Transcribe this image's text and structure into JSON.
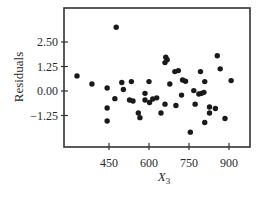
{
  "chart_data": {
    "type": "scatter",
    "title": "",
    "xlabel": "X3",
    "xlabel_main": "X",
    "xlabel_sub": "3",
    "ylabel": "Residuals",
    "xlim": [
      300,
      1010
    ],
    "ylim": [
      -3.0,
      4.4
    ],
    "xticks": [
      450,
      600,
      750,
      900
    ],
    "xtick_labels": [
      "450",
      "600",
      "750",
      "900"
    ],
    "yticks": [
      2.5,
      1.25,
      0.0,
      -1.25
    ],
    "ytick_labels": [
      "2.50",
      "1.25",
      "0.00",
      "−1.25"
    ],
    "grid": false,
    "legend": null,
    "marker_color": "#1a1a1a",
    "points": [
      {
        "x": 330,
        "y": 0.77
      },
      {
        "x": 386,
        "y": 0.36
      },
      {
        "x": 443,
        "y": 0.15
      },
      {
        "x": 443,
        "y": -0.87
      },
      {
        "x": 443,
        "y": -1.53
      },
      {
        "x": 477,
        "y": 3.25
      },
      {
        "x": 472,
        "y": -0.39
      },
      {
        "x": 498,
        "y": 0.43
      },
      {
        "x": 504,
        "y": 0.08
      },
      {
        "x": 527,
        "y": -0.46
      },
      {
        "x": 534,
        "y": 0.48
      },
      {
        "x": 540,
        "y": -0.51
      },
      {
        "x": 560,
        "y": -1.12
      },
      {
        "x": 566,
        "y": -1.36
      },
      {
        "x": 585,
        "y": -0.12
      },
      {
        "x": 585,
        "y": -0.46
      },
      {
        "x": 600,
        "y": 0.48
      },
      {
        "x": 602,
        "y": -0.59
      },
      {
        "x": 614,
        "y": -0.41
      },
      {
        "x": 629,
        "y": -0.35
      },
      {
        "x": 645,
        "y": -1.12
      },
      {
        "x": 660,
        "y": 1.45
      },
      {
        "x": 663,
        "y": 1.72
      },
      {
        "x": 668,
        "y": 1.6
      },
      {
        "x": 660,
        "y": -0.67
      },
      {
        "x": 678,
        "y": 0.36
      },
      {
        "x": 697,
        "y": 0.99
      },
      {
        "x": 701,
        "y": -0.74
      },
      {
        "x": 710,
        "y": 1.04
      },
      {
        "x": 722,
        "y": -0.21
      },
      {
        "x": 726,
        "y": 0.56
      },
      {
        "x": 737,
        "y": 0.5
      },
      {
        "x": 755,
        "y": -2.1
      },
      {
        "x": 768,
        "y": 0.02
      },
      {
        "x": 773,
        "y": -0.67
      },
      {
        "x": 787,
        "y": -0.15
      },
      {
        "x": 793,
        "y": 0.99
      },
      {
        "x": 797,
        "y": -0.12
      },
      {
        "x": 806,
        "y": -0.07
      },
      {
        "x": 809,
        "y": 0.48
      },
      {
        "x": 809,
        "y": -1.61
      },
      {
        "x": 827,
        "y": -0.82
      },
      {
        "x": 827,
        "y": -1.12
      },
      {
        "x": 849,
        "y": -0.89
      },
      {
        "x": 856,
        "y": 1.8
      },
      {
        "x": 867,
        "y": 1.13
      },
      {
        "x": 885,
        "y": -1.4
      },
      {
        "x": 908,
        "y": 0.53
      }
    ]
  }
}
